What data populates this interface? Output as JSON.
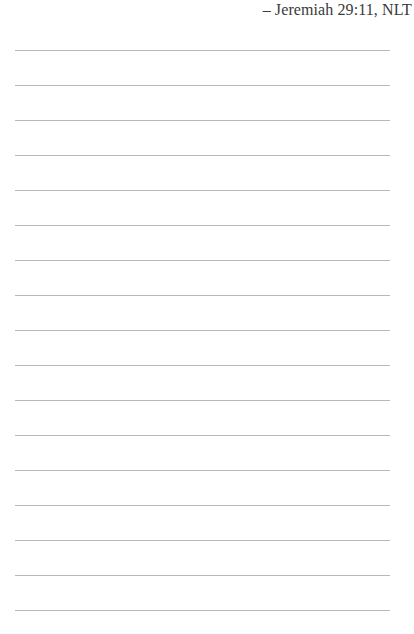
{
  "header": {
    "citation": "– Jeremiah 29:11, NLT"
  },
  "page": {
    "rule_color": "#b8b8b8",
    "rule_count": 17,
    "first_rule_y": 50,
    "rule_spacing": 35
  }
}
